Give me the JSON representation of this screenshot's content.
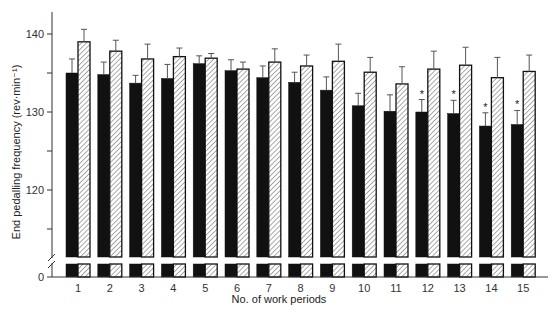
{
  "chart_data": {
    "type": "bar",
    "title": "",
    "xlabel": "No. of work periods",
    "ylabel": "End pedalling frequency (rev·min⁻¹)",
    "ylim": [
      0,
      142
    ],
    "axis_break": true,
    "y_ticks": [
      0,
      120,
      130,
      140
    ],
    "y_minor_ticks": [
      115,
      125,
      135
    ],
    "grid": false,
    "legend": null,
    "categories": [
      "1",
      "2",
      "3",
      "4",
      "5",
      "6",
      "7",
      "8",
      "9",
      "10",
      "11",
      "12",
      "13",
      "14",
      "15"
    ],
    "series": [
      {
        "name": "Condition A (solid black)",
        "fill": "solid",
        "color": "#111111",
        "values": [
          135.0,
          134.8,
          133.7,
          134.3,
          136.2,
          135.3,
          134.4,
          133.8,
          132.8,
          130.8,
          130.1,
          130.0,
          129.8,
          128.2,
          128.4
        ],
        "errors": [
          1.8,
          1.6,
          1.0,
          1.8,
          1.0,
          1.4,
          1.5,
          1.3,
          1.7,
          1.6,
          2.1,
          1.6,
          1.7,
          1.7,
          1.8
        ]
      },
      {
        "name": "Condition B (hatched)",
        "fill": "hatched",
        "color": "#ffffff",
        "values": [
          139.0,
          137.8,
          136.8,
          137.1,
          136.9,
          135.5,
          136.4,
          135.9,
          136.5,
          135.1,
          133.6,
          135.5,
          136.0,
          134.4,
          135.2
        ],
        "errors": [
          1.6,
          1.4,
          1.9,
          1.1,
          0.6,
          0.9,
          1.7,
          1.4,
          2.2,
          1.9,
          2.2,
          2.3,
          2.3,
          2.6,
          2.1
        ]
      }
    ],
    "annotations": [
      {
        "category": "12",
        "series": 0,
        "text": "*"
      },
      {
        "category": "13",
        "series": 0,
        "text": "*"
      },
      {
        "category": "14",
        "series": 0,
        "text": "*"
      },
      {
        "category": "15",
        "series": 0,
        "text": "*"
      }
    ]
  },
  "labels": {
    "xlabel": "No. of work periods",
    "ylabel": "End pedalling frequency (rev·min⁻¹)"
  }
}
